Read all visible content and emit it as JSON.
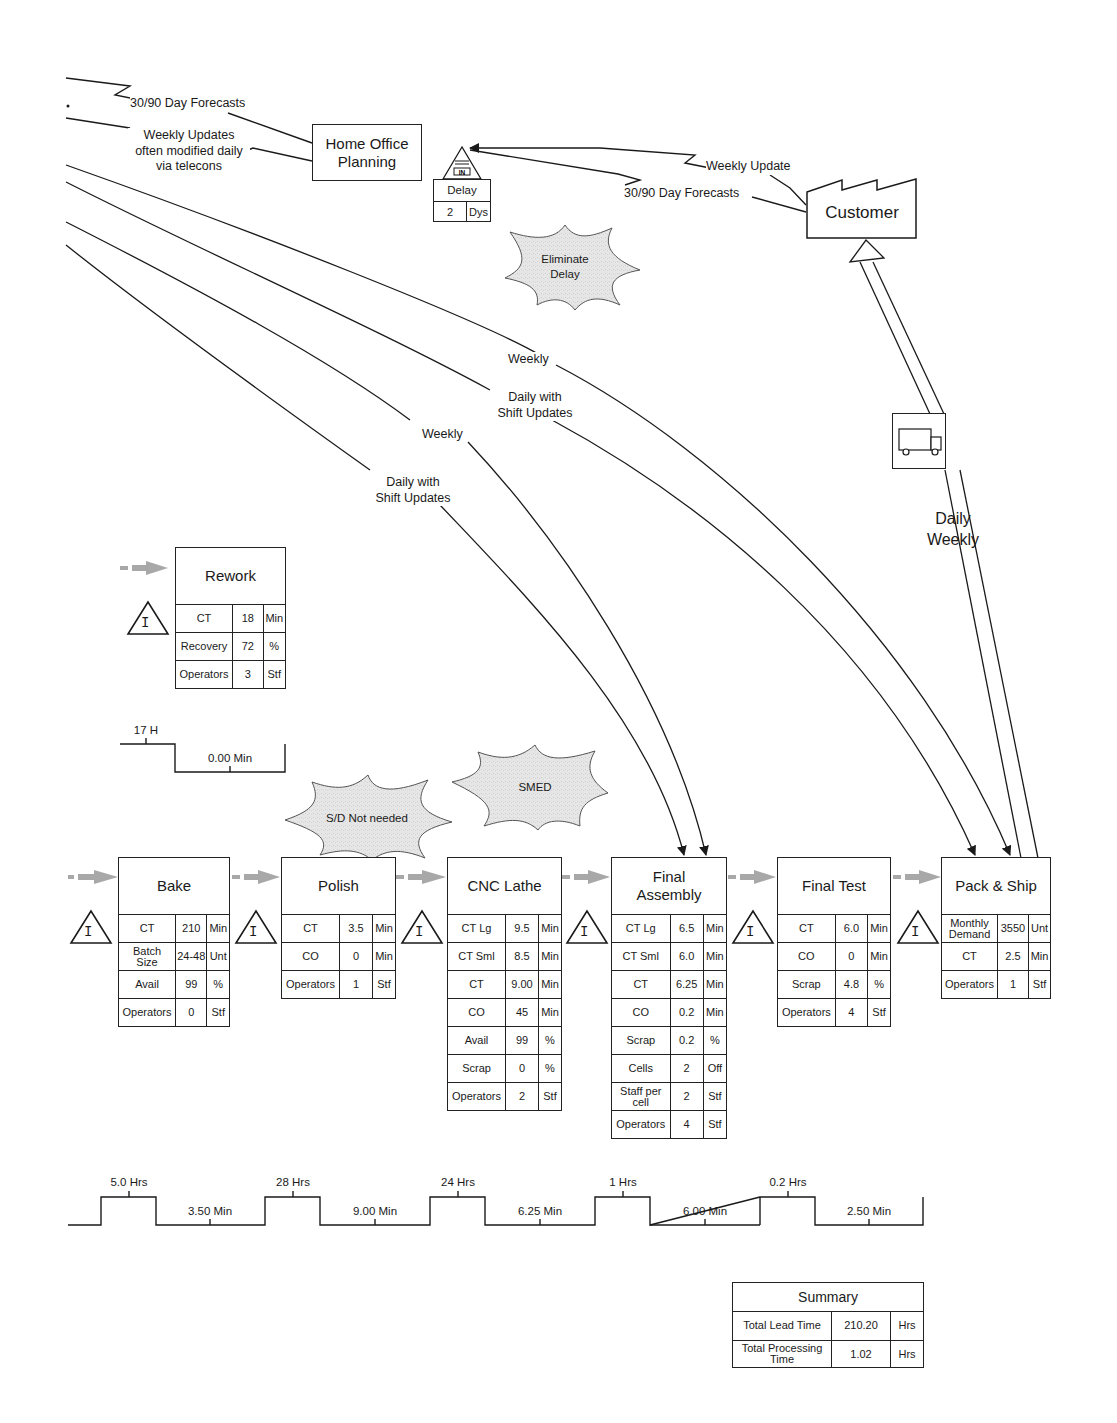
{
  "header_edge_labels": {
    "forecast_left": "30/90 Day Forecasts",
    "weekly_updates": [
      "Weekly Updates",
      "often modified daily",
      "via telecons"
    ]
  },
  "home_office": {
    "title": [
      "Home Office",
      "Planning"
    ]
  },
  "delay_box": {
    "icon": "inbox-in-icon",
    "label": "Delay",
    "value": "2",
    "unit": "Dys"
  },
  "customer": {
    "title": "Customer",
    "icon": "factory-icon",
    "edge_labels": {
      "weekly_update": "Weekly Update",
      "forecasts": "30/90 Day Forecasts"
    }
  },
  "kaizen_bursts": [
    {
      "id": "eliminate-delay",
      "lines": [
        "Eliminate",
        "Delay"
      ],
      "fill": "#e6e6e6"
    },
    {
      "id": "sd-not-needed",
      "lines": [
        "S/D Not needed"
      ],
      "fill": "#e6e6e6"
    },
    {
      "id": "smed",
      "lines": [
        "SMED"
      ],
      "fill": "#e6e6e6"
    }
  ],
  "info_flow_labels": [
    {
      "lines": [
        "Weekly"
      ]
    },
    {
      "lines": [
        "Daily with",
        "Shift Updates"
      ]
    },
    {
      "lines": [
        "Weekly"
      ]
    },
    {
      "lines": [
        "Daily with",
        "Shift Updates"
      ]
    }
  ],
  "shipment": {
    "icon": "truck-icon",
    "labels": [
      "Daily",
      "Weekly"
    ]
  },
  "rework": {
    "title": "Rework",
    "rows": [
      {
        "label": "CT",
        "value": "18",
        "unit": "Min"
      },
      {
        "label": "Recovery",
        "value": "72",
        "unit": "%"
      },
      {
        "label": "Operators",
        "value": "3",
        "unit": "Stf"
      }
    ],
    "timeline": {
      "wait": "17 H",
      "process": "0.00 Min"
    }
  },
  "inventory_icon_letter": "I",
  "processes": [
    {
      "title": [
        "Bake"
      ],
      "rows": [
        {
          "label": [
            "CT"
          ],
          "value": "210",
          "unit": "Min"
        },
        {
          "label": [
            "Batch",
            "Size"
          ],
          "value": "24-48",
          "unit": "Unt"
        },
        {
          "label": [
            "Avail"
          ],
          "value": "99",
          "unit": "%"
        },
        {
          "label": [
            "Operators"
          ],
          "value": "0",
          "unit": "Stf"
        }
      ]
    },
    {
      "title": [
        "Polish"
      ],
      "rows": [
        {
          "label": [
            "CT"
          ],
          "value": "3.5",
          "unit": "Min"
        },
        {
          "label": [
            "CO"
          ],
          "value": "0",
          "unit": "Min"
        },
        {
          "label": [
            "Operators"
          ],
          "value": "1",
          "unit": "Stf"
        }
      ]
    },
    {
      "title": [
        "CNC Lathe"
      ],
      "rows": [
        {
          "label": [
            "CT Lg"
          ],
          "value": "9.5",
          "unit": "Min"
        },
        {
          "label": [
            "CT Sml"
          ],
          "value": "8.5",
          "unit": "Min"
        },
        {
          "label": [
            "CT"
          ],
          "value": "9.00",
          "unit": "Min"
        },
        {
          "label": [
            "CO"
          ],
          "value": "45",
          "unit": "Min"
        },
        {
          "label": [
            "Avail"
          ],
          "value": "99",
          "unit": "%"
        },
        {
          "label": [
            "Scrap"
          ],
          "value": "0",
          "unit": "%"
        },
        {
          "label": [
            "Operators"
          ],
          "value": "2",
          "unit": "Stf"
        }
      ]
    },
    {
      "title": [
        "Final",
        "Assembly"
      ],
      "rows": [
        {
          "label": [
            "CT Lg"
          ],
          "value": "6.5",
          "unit": "Min"
        },
        {
          "label": [
            "CT Sml"
          ],
          "value": "6.0",
          "unit": "Min"
        },
        {
          "label": [
            "CT"
          ],
          "value": "6.25",
          "unit": "Min"
        },
        {
          "label": [
            "CO"
          ],
          "value": "0.2",
          "unit": "Min"
        },
        {
          "label": [
            "Scrap"
          ],
          "value": "0.2",
          "unit": "%"
        },
        {
          "label": [
            "Cells"
          ],
          "value": "2",
          "unit": "Off"
        },
        {
          "label": [
            "Staff per",
            "cell"
          ],
          "value": "2",
          "unit": "Stf"
        },
        {
          "label": [
            "Operators"
          ],
          "value": "4",
          "unit": "Stf"
        }
      ]
    },
    {
      "title": [
        "Final Test"
      ],
      "rows": [
        {
          "label": [
            "CT"
          ],
          "value": "6.0",
          "unit": "Min"
        },
        {
          "label": [
            "CO"
          ],
          "value": "0",
          "unit": "Min"
        },
        {
          "label": [
            "Scrap"
          ],
          "value": "4.8",
          "unit": "%"
        },
        {
          "label": [
            "Operators"
          ],
          "value": "4",
          "unit": "Stf"
        }
      ]
    },
    {
      "title": [
        "Pack & Ship"
      ],
      "rows": [
        {
          "label": [
            "Monthly",
            "Demand"
          ],
          "value": "3550",
          "unit": "Unt"
        },
        {
          "label": [
            "CT"
          ],
          "value": "2.5",
          "unit": "Min"
        },
        {
          "label": [
            "Operators"
          ],
          "value": "1",
          "unit": "Stf"
        }
      ]
    }
  ],
  "timeline": {
    "waits": [
      "5.0 Hrs",
      "28 Hrs",
      "24 Hrs",
      "1 Hrs",
      "0.2 Hrs"
    ],
    "processes": [
      "3.50 Min",
      "9.00 Min",
      "6.25 Min",
      "6.00 Min",
      "2.50 Min"
    ]
  },
  "summary": {
    "title": "Summary",
    "rows": [
      {
        "label": [
          "Total Lead Time"
        ],
        "value": "210.20",
        "unit": "Hrs"
      },
      {
        "label": [
          "Total Processing",
          "Time"
        ],
        "value": "1.02",
        "unit": "Hrs"
      }
    ]
  },
  "colors": {
    "line": "#1a1a1a",
    "push_arrow": "#a8a8a8",
    "burst_fill": "#e6e6e6",
    "background": "#ffffff"
  }
}
